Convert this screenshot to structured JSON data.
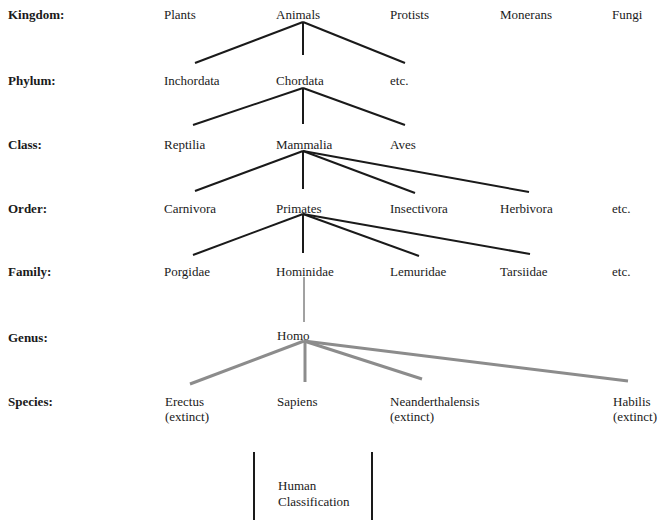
{
  "ranks": [
    {
      "label": "Kingdom:"
    },
    {
      "label": "Phylum:"
    },
    {
      "label": "Class:"
    },
    {
      "label": "Order:"
    },
    {
      "label": "Family:"
    },
    {
      "label": "Genus:"
    },
    {
      "label": "Species:"
    }
  ],
  "kingdom": [
    "Plants",
    "Animals",
    "Protists",
    "Monerans",
    "Fungi"
  ],
  "phylum": [
    "Inchordata",
    "Chordata",
    "etc."
  ],
  "class": [
    "Reptilia",
    "Mammalia",
    "Aves"
  ],
  "order": [
    "Carnivora",
    "Primates",
    "Insectivora",
    "Herbivora",
    "etc."
  ],
  "family": [
    "Porgidae",
    "Hominidae",
    "Lemuridae",
    "Tarsiidae",
    "etc."
  ],
  "genus": [
    "Homo"
  ],
  "species": [
    {
      "name": "Erectus",
      "note": "(extinct)"
    },
    {
      "name": "Sapiens",
      "note": ""
    },
    {
      "name": "Neanderthalensis",
      "note": "(extinct)"
    },
    {
      "name": "Habilis",
      "note": "(extinct)"
    }
  ],
  "caption": {
    "line1": "Human",
    "line2": "Classification"
  },
  "colors": {
    "branch": "#1a1a1a",
    "species_branch": "#8c8c8c",
    "text": "#1a1a1a"
  }
}
